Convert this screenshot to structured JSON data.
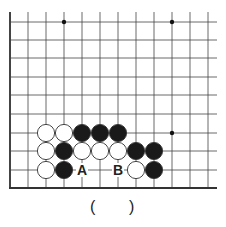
{
  "board": {
    "columns_x": [
      10,
      28,
      46,
      64,
      82,
      100,
      118,
      136,
      154,
      172,
      190,
      208
    ],
    "rows_y": [
      22,
      40,
      58,
      77,
      95,
      114,
      133,
      151,
      170
    ],
    "edge_bottom_y": 188,
    "edge_left_x": 10,
    "right_extent_x": 217,
    "top_extent_y": 12,
    "star_points": [
      [
        64,
        22
      ],
      [
        172,
        22
      ],
      [
        172,
        133
      ]
    ],
    "stones": [
      {
        "color": "white",
        "x": 46,
        "y": 133
      },
      {
        "color": "white",
        "x": 64,
        "y": 133
      },
      {
        "color": "black",
        "x": 82,
        "y": 133
      },
      {
        "color": "black",
        "x": 100,
        "y": 133
      },
      {
        "color": "black",
        "x": 118,
        "y": 133
      },
      {
        "color": "white",
        "x": 46,
        "y": 151
      },
      {
        "color": "black",
        "x": 64,
        "y": 151
      },
      {
        "color": "white",
        "x": 82,
        "y": 151
      },
      {
        "color": "white",
        "x": 100,
        "y": 151
      },
      {
        "color": "white",
        "x": 118,
        "y": 151
      },
      {
        "color": "black",
        "x": 136,
        "y": 151
      },
      {
        "color": "black",
        "x": 154,
        "y": 151
      },
      {
        "color": "white",
        "x": 46,
        "y": 170
      },
      {
        "color": "black",
        "x": 64,
        "y": 170
      },
      {
        "color": "white",
        "x": 136,
        "y": 170
      },
      {
        "color": "black",
        "x": 154,
        "y": 170
      }
    ],
    "labels": [
      {
        "text": "A",
        "x": 82,
        "y": 170
      },
      {
        "text": "B",
        "x": 118,
        "y": 170
      }
    ]
  },
  "answer": {
    "open_paren": "(",
    "close_paren": ")"
  }
}
